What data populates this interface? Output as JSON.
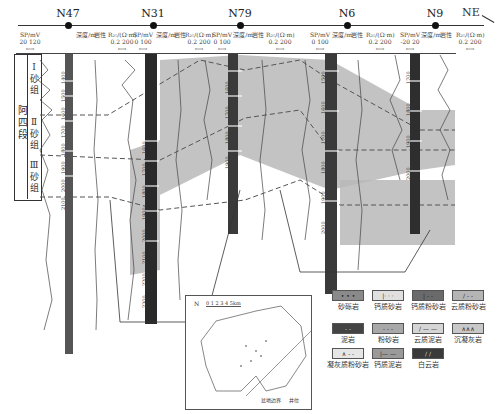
{
  "section": {
    "direction_label": "NE",
    "wells": [
      {
        "name": "N47",
        "x": 68
      },
      {
        "name": "N31",
        "x": 153
      },
      {
        "name": "N79",
        "x": 240
      },
      {
        "name": "N6",
        "x": 347
      },
      {
        "name": "N9",
        "x": 435
      }
    ]
  },
  "track_headers": [
    {
      "label": "SP/mV",
      "range": "20  120",
      "x": 30
    },
    {
      "label": "深度/m",
      "range": "",
      "x": 86
    },
    {
      "label": "岩性",
      "range": "",
      "x": 100
    },
    {
      "label": "R₂₅/(Ω·m)",
      "range": "0.2   200",
      "x": 122
    },
    {
      "label": "SP/mV",
      "range": "0   100",
      "x": 143
    },
    {
      "label": "深度/m",
      "range": "",
      "x": 166
    },
    {
      "label": "岩性",
      "range": "",
      "x": 180
    },
    {
      "label": "R₂₅/(Ω·m)",
      "range": "0.2   200",
      "x": 199
    },
    {
      "label": "SP/mV",
      "range": "0   100",
      "x": 222
    },
    {
      "label": "深度/m",
      "range": "",
      "x": 243
    },
    {
      "label": "岩性",
      "range": "",
      "x": 258
    },
    {
      "label": "R₂₅/(Ω·m)",
      "range": "0.2   200",
      "x": 280
    },
    {
      "label": "SP/mV",
      "range": "0   100",
      "x": 320
    },
    {
      "label": "深度/m",
      "range": "",
      "x": 342
    },
    {
      "label": "岩性",
      "range": "",
      "x": 357
    },
    {
      "label": "R₂₅/(Ω·m)",
      "range": "0.2   200",
      "x": 380
    },
    {
      "label": "SP/mV",
      "range": "-20   20",
      "x": 410
    },
    {
      "label": "深度/m",
      "range": "",
      "x": 431
    },
    {
      "label": "岩性",
      "range": "",
      "x": 446
    },
    {
      "label": "R₂₅/(Ω·m)",
      "range": "0.2   200",
      "x": 470
    }
  ],
  "stratigraphy": {
    "member": "阿四段",
    "groups": [
      "Ⅰ砂组",
      "Ⅱ砂组",
      "Ⅲ砂组"
    ]
  },
  "depth_labels": {
    "N47": [
      "1400",
      "1500",
      "1600",
      "1700",
      "1800",
      "1900",
      "2000",
      "2100"
    ],
    "N31": [
      "1600",
      "1700",
      "1800",
      "1900",
      "2000",
      "2100",
      "2200",
      "2300"
    ],
    "N79": [
      "1600",
      "1700",
      "1800",
      "1900"
    ],
    "N6": [
      "1500",
      "1600",
      "1700",
      "1800",
      "1900",
      "2000"
    ],
    "N9": [
      "1700",
      "1800",
      "1900",
      "2000"
    ]
  },
  "inset_map": {
    "scale_label": "0 1 2 3 4 5km",
    "north_label": "N",
    "legend": [
      "盆地边界",
      "井位"
    ],
    "well_labels": [
      "N47",
      "N31",
      "N79",
      "N6",
      "N9",
      "N56",
      "N71",
      "N91",
      "N51",
      "N11",
      "N36",
      "N14"
    ]
  },
  "legend": [
    {
      "label": "砂砾岩",
      "pattern": "• • •",
      "fill": "#8a8a8a"
    },
    {
      "label": "钙质砂岩",
      "pattern": "|· · ·",
      "fill": "#e0e0e0"
    },
    {
      "label": "钙质粉砂岩",
      "pattern": "| - -",
      "fill": "#6a6a6a"
    },
    {
      "label": "云质粉砂岩",
      "pattern": "/ - -",
      "fill": "#b5b5b5"
    },
    {
      "label": "泥岩",
      "pattern": "- -",
      "fill": "#444444"
    },
    {
      "label": "粉砂岩",
      "pattern": "- - -",
      "fill": "#a8a8a8"
    },
    {
      "label": "云质泥岩",
      "pattern": "/ — —",
      "fill": "#d5d5d5"
    },
    {
      "label": "沉凝灰岩",
      "pattern": "∧∧∧",
      "fill": "#c8c8c8"
    },
    {
      "label": "凝灰质粉砂岩",
      "pattern": "∧ - -",
      "fill": "#e6e6e6"
    },
    {
      "label": "钙质泥岩",
      "pattern": "|— —",
      "fill": "#9a9a9a"
    },
    {
      "label": "白云岩",
      "pattern": "/ /",
      "fill": "#3a3a3a"
    }
  ]
}
